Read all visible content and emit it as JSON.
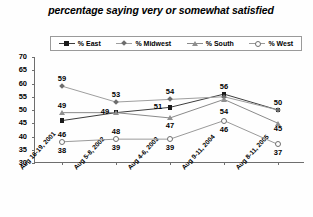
{
  "chart_data": {
    "type": "line",
    "title": "percentage saying very or somewhat satisfied",
    "xlabel": "",
    "ylabel": "",
    "ylim": [
      30,
      70
    ],
    "ytick_labels": [
      "70",
      "65",
      "60",
      "55",
      "50",
      "45",
      "40",
      "35",
      "30"
    ],
    "ytick_values": [
      70,
      65,
      60,
      55,
      50,
      45,
      40,
      35,
      30
    ],
    "grid": false,
    "legend_position": "top",
    "categories": [
      "Aug 16-19, 2001",
      "Aug 5-8, 2002",
      "Aug 4-6, 2003",
      "Aug 9-11, 2004",
      "Aug 8-11, 2005"
    ],
    "series": [
      {
        "name": "% East",
        "marker": "square",
        "color": "#1a1a1a",
        "line_color": "#3d3d3d",
        "values": [
          46,
          49,
          51,
          56,
          50
        ]
      },
      {
        "name": "% Midwest",
        "marker": "diamond",
        "color": "#6d6d6d",
        "line_color": "#9e9e9e",
        "values": [
          59,
          53,
          54,
          55,
          50
        ]
      },
      {
        "name": "% South",
        "marker": "triangle",
        "color": "#8f8f8f",
        "line_color": "#8a8a8a",
        "values": [
          49,
          49,
          47,
          54,
          45
        ]
      },
      {
        "name": "% West",
        "marker": "circle",
        "color": "#6f6f6f",
        "line_color": "#9a9a9a",
        "values": [
          38,
          39,
          39,
          46,
          37
        ]
      }
    ],
    "point_labels": [
      {
        "text": "59",
        "x": 0,
        "y": 59,
        "dx": 0,
        "dy": -11
      },
      {
        "text": "49",
        "x": 0,
        "y": 49,
        "dx": 0,
        "dy": -11
      },
      {
        "text": "46",
        "x": 0,
        "y": 38,
        "dx": 0,
        "dy": -11
      },
      {
        "text": "38",
        "x": 0,
        "y": 38,
        "dx": 0,
        "dy": 5
      },
      {
        "text": "53",
        "x": 1,
        "y": 53,
        "dx": 0,
        "dy": -11
      },
      {
        "text": "49",
        "x": 1,
        "y": 49,
        "dx": -11,
        "dy": -5
      },
      {
        "text": "48",
        "x": 1,
        "y": 39,
        "dx": 0,
        "dy": -11
      },
      {
        "text": "39",
        "x": 1,
        "y": 39,
        "dx": 0,
        "dy": 5
      },
      {
        "text": "54",
        "x": 2,
        "y": 54,
        "dx": 0,
        "dy": -11
      },
      {
        "text": "51",
        "x": 2,
        "y": 51,
        "dx": -12,
        "dy": -4
      },
      {
        "text": "47",
        "x": 2,
        "y": 47,
        "dx": 0,
        "dy": 4
      },
      {
        "text": "39",
        "x": 2,
        "y": 39,
        "dx": 0,
        "dy": 5
      },
      {
        "text": "56",
        "x": 3,
        "y": 56,
        "dx": 0,
        "dy": -11
      },
      {
        "text": "54",
        "x": 3,
        "y": 50,
        "dx": 0,
        "dy": -2
      },
      {
        "text": "46",
        "x": 3,
        "y": 46,
        "dx": 0,
        "dy": 5
      },
      {
        "text": "50",
        "x": 4,
        "y": 50,
        "dx": 0,
        "dy": -11
      },
      {
        "text": "45",
        "x": 4,
        "y": 45,
        "dx": 0,
        "dy": 2
      },
      {
        "text": "37",
        "x": 4,
        "y": 37,
        "dx": 0,
        "dy": 5
      }
    ]
  },
  "legend": {
    "items": [
      {
        "label": "% East",
        "marker": "square-marker-icon"
      },
      {
        "label": "% Midwest",
        "marker": "diamond-marker-icon"
      },
      {
        "label": "% South",
        "marker": "triangle-marker-icon"
      },
      {
        "label": "% West",
        "marker": "circle-marker-icon"
      }
    ]
  }
}
